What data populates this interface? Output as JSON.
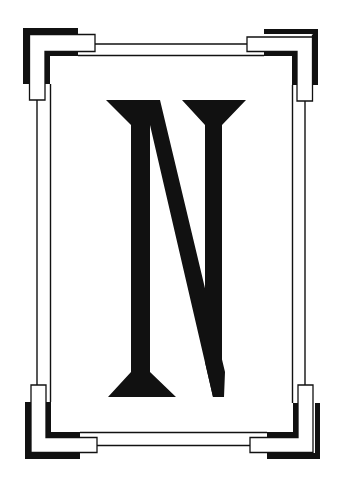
{
  "image": {
    "subject": "Decorative art-deco frame with letter N",
    "letter": "N"
  },
  "colors": {
    "background": "#ffffff",
    "ink": "#111111"
  },
  "frame": {
    "corners": [
      "top-left",
      "top-right",
      "bottom-left",
      "bottom-right"
    ],
    "style": "double-line border with stepped L-shaped corner ornaments"
  }
}
